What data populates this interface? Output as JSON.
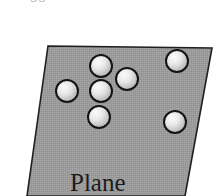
{
  "figure": {
    "type": "geometry-diagram",
    "background_color": "#ffffff",
    "width": 217,
    "height": 196,
    "top_fragment_text": "ss",
    "plane": {
      "label": "Plane",
      "fill_color": "#9b9b9b",
      "stroke_color": "#1a1a1a",
      "shape": "parallelogram",
      "points": "48,46 212,48 185,196 27,196"
    },
    "points": [
      {
        "name": "point-top-left-upper",
        "cx": 101,
        "cy": 66,
        "r": 11
      },
      {
        "name": "point-top-right-inner",
        "cx": 127,
        "cy": 79,
        "r": 11
      },
      {
        "name": "point-left",
        "cx": 67,
        "cy": 91,
        "r": 11
      },
      {
        "name": "point-center",
        "cx": 101,
        "cy": 91,
        "r": 11
      },
      {
        "name": "point-bottom-center",
        "cx": 99,
        "cy": 117,
        "r": 11
      },
      {
        "name": "point-top-right",
        "cx": 177,
        "cy": 61,
        "r": 11
      },
      {
        "name": "point-bottom-right",
        "cx": 175,
        "cy": 122,
        "r": 11
      }
    ],
    "point_style": {
      "outline_color": "#141414",
      "fill_light": "#f2f2f2",
      "fill_dark": "#b4b4b4",
      "outline_width": 2
    }
  }
}
